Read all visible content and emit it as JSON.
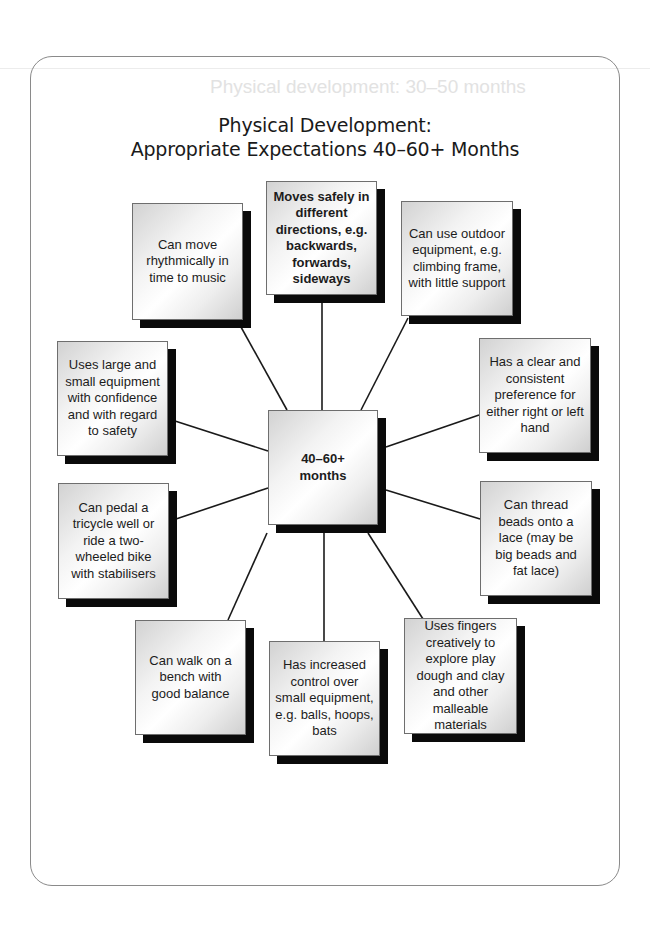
{
  "diagram": {
    "title_line1": "Physical Development:",
    "title_line2": "Appropriate Expectations 40–60+ Months",
    "center": {
      "label": "40–60+ months"
    },
    "nodes": [
      {
        "id": "top-left",
        "label": "Can move rhythmically in time to music"
      },
      {
        "id": "top-center",
        "label": "Moves safely in different directions, e.g. backwards, forwards, sideways",
        "bold": true
      },
      {
        "id": "top-right",
        "label": "Can use outdoor equipment, e.g. climbing frame, with little support"
      },
      {
        "id": "right-upper",
        "label": "Has a clear and consistent preference for either right or left hand"
      },
      {
        "id": "right-lower",
        "label": "Can thread beads onto a lace (may be big beads and fat lace)"
      },
      {
        "id": "bottom-right",
        "label": "Uses fingers creatively to explore play dough and clay and other malleable materials"
      },
      {
        "id": "bottom-center",
        "label": "Has increased control over small equipment, e.g. balls, hoops, bats"
      },
      {
        "id": "bottom-left",
        "label": "Can walk on a bench with good balance"
      },
      {
        "id": "left-lower",
        "label": "Can pedal a tricycle well or ride a two-wheeled bike with stabilisers"
      },
      {
        "id": "left-upper",
        "label": "Uses large and small equipment with confidence and with regard to safety"
      }
    ]
  },
  "bleed_through": {
    "heading": "Physical development: 30–50 months"
  }
}
